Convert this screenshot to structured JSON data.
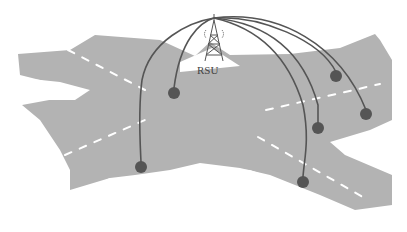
{
  "diagram": {
    "rsu_label": "RSU",
    "colors": {
      "road": "#b3b3b3",
      "lane_marking": "#ffffff",
      "link": "#555555",
      "vehicle": "#555555",
      "tower": "#555555",
      "background": "#ffffff"
    },
    "rsu": {
      "x": 214,
      "y": 18
    },
    "vehicles": [
      {
        "x": 174,
        "y": 93
      },
      {
        "x": 141,
        "y": 167
      },
      {
        "x": 336,
        "y": 76
      },
      {
        "x": 366,
        "y": 114
      },
      {
        "x": 318,
        "y": 128
      },
      {
        "x": 303,
        "y": 182
      }
    ]
  }
}
